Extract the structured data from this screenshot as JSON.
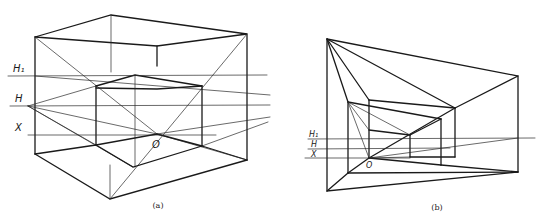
{
  "figure": {
    "panels": [
      {
        "id": "a",
        "caption": "(a)",
        "labels": {
          "h1": "H₁",
          "h": "H",
          "x": "X",
          "o": "O"
        }
      },
      {
        "id": "b",
        "caption": "(b)",
        "labels": {
          "h1": "H₁",
          "h": "H",
          "x": "X",
          "o": "O"
        }
      }
    ]
  },
  "colors": {
    "ink": "#1a1a1a",
    "background": "#ffffff"
  }
}
